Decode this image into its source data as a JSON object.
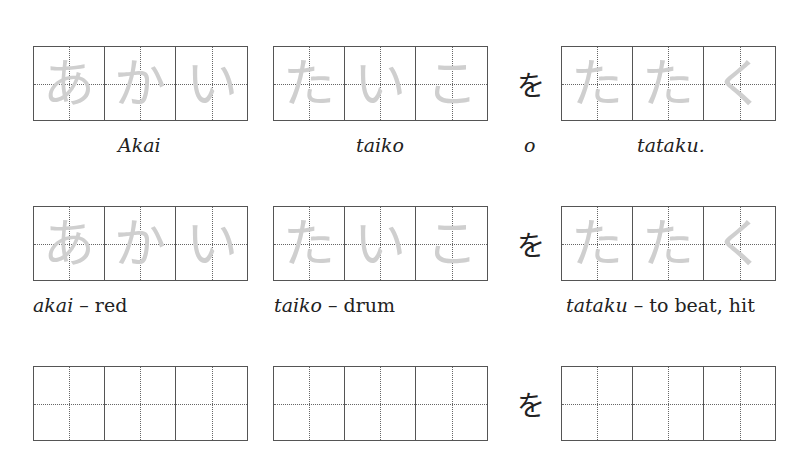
{
  "rows": [
    {
      "words": [
        {
          "kana": [
            "あ",
            "か",
            "い"
          ],
          "caption": "Akai"
        },
        {
          "kana": [
            "た",
            "い",
            "こ"
          ],
          "caption": "taiko"
        },
        {
          "kana": [
            "た",
            "た",
            "く"
          ],
          "caption": "tataku."
        }
      ],
      "particle": "を",
      "particle_caption": "o"
    },
    {
      "words": [
        {
          "kana": [
            "あ",
            "か",
            "い"
          ],
          "caption_romaji": "akai",
          "caption_meaning": "– red"
        },
        {
          "kana": [
            "た",
            "い",
            "こ"
          ],
          "caption_romaji": "taiko",
          "caption_meaning": "– drum"
        },
        {
          "kana": [
            "た",
            "た",
            "く"
          ],
          "caption_romaji": "tataku",
          "caption_meaning": "– to beat, hit"
        }
      ],
      "particle": "を"
    },
    {
      "words": [
        {
          "kana": [
            "",
            "",
            ""
          ]
        },
        {
          "kana": [
            "",
            "",
            ""
          ]
        },
        {
          "kana": [
            "",
            "",
            ""
          ]
        }
      ],
      "particle": "を"
    }
  ]
}
